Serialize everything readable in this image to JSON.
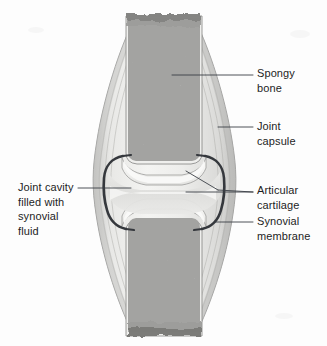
{
  "figure": {
    "background_color": "#fdfdfd",
    "width": 327,
    "height": 346
  },
  "labels": {
    "spongy_bone": "Spongy\nbone",
    "joint_capsule": "Joint\ncapsule",
    "articular_cartilage": "Articular\ncartilage",
    "synovial_membrane": "Synovial\nmembrane",
    "joint_cavity": "Joint cavity\nfilled with\nsynovial\nfluid"
  },
  "colors": {
    "text": "#1e1e1e",
    "leader_line": "#3b3f46",
    "bone_base": "#9a9a9a",
    "bone_speckle": "#5d5d5d",
    "cartilage": "#f2f2f0",
    "capsule_fill": "#dcdcda",
    "capsule_outline": "#8b8b8b",
    "synovial_membrane": "#35383d",
    "joint_cavity": "#e4e4e2"
  },
  "structures": [
    {
      "name": "spongy-bone-upper",
      "description": "Trabecular bone of upper epiphysis and shaft"
    },
    {
      "name": "spongy-bone-lower",
      "description": "Trabecular bone of lower epiphysis and shaft"
    },
    {
      "name": "joint-capsule",
      "description": "Fibrous spindle-shaped sheath enclosing the joint"
    },
    {
      "name": "articular-cartilage-upper",
      "description": "Cartilage cap on upper bone end"
    },
    {
      "name": "articular-cartilage-lower",
      "description": "Cartilage cap on lower bone end"
    },
    {
      "name": "joint-cavity",
      "description": "Space filled with synovial fluid"
    },
    {
      "name": "synovial-membrane",
      "description": "Dark inner lining of the joint capsule"
    }
  ]
}
